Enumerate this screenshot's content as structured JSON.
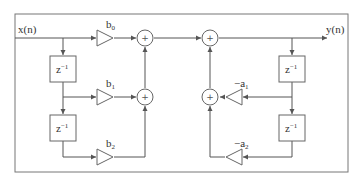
{
  "diagram": {
    "type": "signal-flow",
    "input_label": "x(n)",
    "output_label": "y(n)",
    "delay_label": "z",
    "delay_exp": "−1",
    "sum_symbol": "+",
    "feedforward_gains": [
      {
        "base": "b",
        "sub": "0"
      },
      {
        "base": "b",
        "sub": "1"
      },
      {
        "base": "b",
        "sub": "2"
      }
    ],
    "feedback_gains": [
      {
        "base": "−a",
        "sub": "1"
      },
      {
        "base": "−a",
        "sub": "2"
      }
    ],
    "colors": {
      "line": "#555555",
      "border": "#666666",
      "text": "#333333",
      "background": "#ffffff"
    }
  }
}
